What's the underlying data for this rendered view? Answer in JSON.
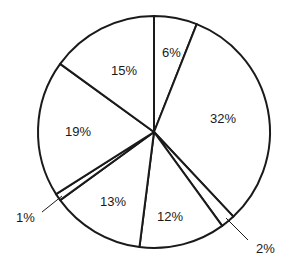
{
  "chart_data": {
    "type": "pie",
    "title": "",
    "start_angle_deg": 0,
    "direction": "clockwise",
    "slices": [
      {
        "label": "6%",
        "value": 6
      },
      {
        "label": "32%",
        "value": 32
      },
      {
        "label": "2%",
        "value": 2
      },
      {
        "label": "12%",
        "value": 12
      },
      {
        "label": "13%",
        "value": 13
      },
      {
        "label": "1%",
        "value": 1
      },
      {
        "label": "19%",
        "value": 19
      },
      {
        "label": "15%",
        "value": 15
      }
    ],
    "labels": {
      "s6": "6%",
      "s32": "32%",
      "s2": "2%",
      "s12": "12%",
      "s13": "13%",
      "s1": "1%",
      "s19": "19%",
      "s15": "15%"
    },
    "colors": {
      "stroke": "#1a1a1a",
      "fill": "#ffffff"
    },
    "legend": "none"
  }
}
